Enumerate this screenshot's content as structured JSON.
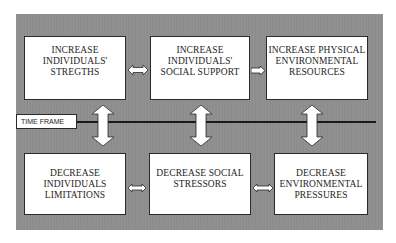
{
  "diagram": {
    "background_color": "#8e8e8e",
    "box_color": "#ffffff",
    "border_color": "#2a2a2a",
    "top_row": [
      {
        "id": "increase-individuals-strengths",
        "lines": [
          "INCREASE",
          "INDIVIDUALS'",
          "STREGTHS"
        ]
      },
      {
        "id": "increase-individuals-social-support",
        "lines": [
          "INCREASE",
          "INDIVIDUALS'",
          "SOCIAL SUPPORT"
        ]
      },
      {
        "id": "increase-physical-environmental-resources",
        "lines": [
          "INCREASE PHYSICAL",
          "ENVIRONMENTAL",
          "RESOURCES"
        ]
      }
    ],
    "bottom_row": [
      {
        "id": "decrease-individuals-limitations",
        "lines": [
          "DECREASE",
          "INDIVIDUALS",
          "LIMITATIONS"
        ]
      },
      {
        "id": "decrease-social-stressors",
        "lines": [
          "DECREASE SOCIAL",
          "STRESSORS"
        ]
      },
      {
        "id": "decrease-environmental-pressures",
        "lines": [
          "DECREASE",
          "ENVIRONMENTAL",
          "PRESSURES"
        ]
      }
    ],
    "timeline": {
      "label": "TIME FRAME"
    },
    "connectors": {
      "top_1_2": "double-horizontal",
      "top_2_3": "right",
      "bottom_1_2": "double-horizontal",
      "bottom_2_3": "double-horizontal",
      "vertical": [
        "double-vertical",
        "double-vertical",
        "double-vertical"
      ]
    }
  }
}
